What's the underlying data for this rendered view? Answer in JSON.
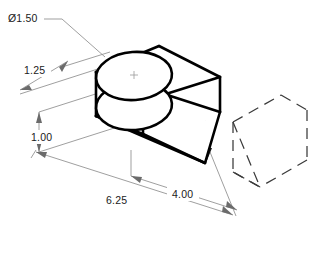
{
  "drawing": {
    "title": "Isometric pictorial of a wedge block with cylindrical boss",
    "projection": "isometric",
    "units": "inches",
    "background_color": "#ffffff",
    "line_color": "#000000",
    "dimension_color": "#8e8e8e",
    "phantom_color": "#3a3a3a"
  },
  "dimensions": [
    {
      "id": "diameter",
      "label": "Ø1.50",
      "value": 1.5,
      "symbol": "diameter",
      "feature": "cylindrical boss",
      "style": "leader",
      "text_x": 8,
      "text_y": 22
    },
    {
      "id": "height-upper",
      "label": "1.25",
      "value": 1.25,
      "feature": "boss height",
      "style": "isometric-aligned",
      "text_x": 24,
      "text_y": 74
    },
    {
      "id": "height-lower",
      "label": "1.00",
      "value": 1.0,
      "feature": "base thickness",
      "style": "vertical",
      "text_x": 31,
      "text_y": 141
    },
    {
      "id": "length-overall",
      "label": "6.25",
      "value": 6.25,
      "feature": "overall length",
      "style": "isometric-aligned",
      "text_x": 106,
      "text_y": 204
    },
    {
      "id": "length-partial",
      "label": "4.00",
      "value": 4.0,
      "feature": "base length",
      "style": "isometric-aligned",
      "text_x": 172,
      "text_y": 198
    }
  ],
  "features": [
    {
      "name": "wedge-block",
      "type": "solid",
      "edge_style": "visible"
    },
    {
      "name": "cylindrical-boss",
      "type": "cylinder",
      "edge_style": "visible"
    },
    {
      "name": "phantom-volume",
      "type": "reference-box",
      "edge_style": "dashed"
    }
  ]
}
